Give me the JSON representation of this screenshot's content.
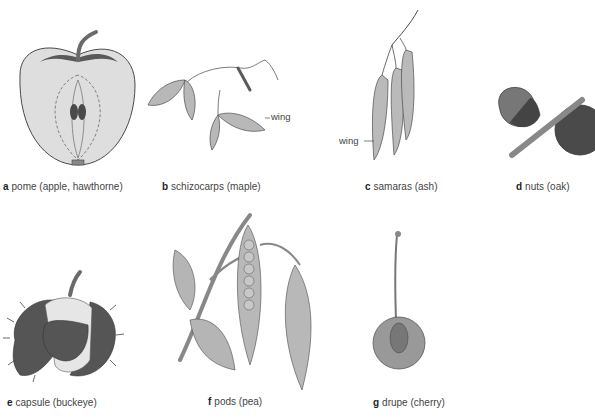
{
  "figure": {
    "panels": [
      {
        "id": "a",
        "letter": "a",
        "label": "pome (apple, hawthorne)"
      },
      {
        "id": "b",
        "letter": "b",
        "label": "schizocarps (maple)",
        "callout": "wing"
      },
      {
        "id": "c",
        "letter": "c",
        "label": "samaras (ash)",
        "callout": "wing"
      },
      {
        "id": "d",
        "letter": "d",
        "label": "nuts (oak)"
      },
      {
        "id": "e",
        "letter": "e",
        "label": "capsule (buckeye)"
      },
      {
        "id": "f",
        "letter": "f",
        "label": "pods (pea)"
      },
      {
        "id": "g",
        "letter": "g",
        "label": "drupe (cherry)"
      }
    ],
    "colors": {
      "background": "#ffffff",
      "light_fill": "#dcdcdc",
      "mid_fill": "#a8a8a8",
      "dark_fill": "#5a5a5a",
      "outline": "#4a4a4a"
    }
  }
}
